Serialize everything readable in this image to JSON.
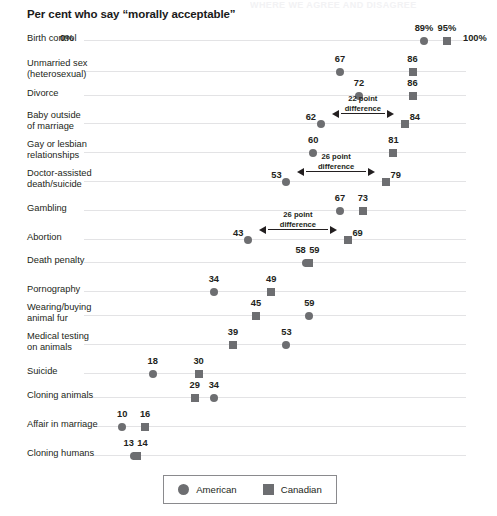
{
  "cutoff_text": "WHERE WE AGREE AND DISAGREE",
  "chart_title": "Per cent who say “morally acceptable”",
  "axis": {
    "min_label": "0%",
    "max_label": "100%",
    "min": 0,
    "max": 100
  },
  "legend": {
    "american_label": "American",
    "canadian_label": "Canadian",
    "american_marker": "circle-marker",
    "canadian_marker": "square-marker"
  },
  "colors": {
    "marker": "#6d6e71",
    "axis_line": "#e3e3e5",
    "text": "#231f20"
  },
  "chart_data": {
    "type": "scatter",
    "title": "Per cent who say “morally acceptable”",
    "xlabel": "",
    "ylabel": "",
    "xlim": [
      0,
      100
    ],
    "grid": false,
    "legend_position": "bottom",
    "series": [
      {
        "name": "American",
        "marker": "circle",
        "values": [
          89,
          67,
          72,
          62,
          60,
          53,
          67,
          43,
          58,
          34,
          59,
          53,
          18,
          34,
          10,
          13
        ]
      },
      {
        "name": "Canadian",
        "marker": "square",
        "values": [
          95,
          86,
          86,
          84,
          81,
          79,
          73,
          69,
          59,
          49,
          45,
          39,
          30,
          29,
          16,
          14
        ]
      }
    ],
    "categories": [
      "Birth control",
      "Unmarried sex\n(heterosexual)",
      "Divorce",
      "Baby outside\nof marriage",
      "Gay or lesbian\nrelationships",
      "Doctor-assisted\ndeath/suicide",
      "Gambling",
      "Abortion",
      "Death penalty",
      "Pornography",
      "Wearing/buying\nanimal fur",
      "Medical testing\non animals",
      "Suicide",
      "Cloning animals",
      "Affair in marriage",
      "Cloning humans"
    ],
    "annotations": [
      {
        "category": "Baby outside\nof marriage",
        "text": "22 point\ndifference",
        "from": 62,
        "to": 84
      },
      {
        "category": "Doctor-assisted\ndeath/suicide",
        "text": "26 point\ndifference",
        "from": 53,
        "to": 79
      },
      {
        "category": "Abortion",
        "text": "26 point\ndifference",
        "from": 43,
        "to": 69
      }
    ]
  },
  "rows": [
    {
      "label": "Birth control",
      "lines": 1,
      "y": 40,
      "american": 89,
      "canadian": 95,
      "am_label": "89%",
      "ca_label": "95%",
      "am_lab_dx": 0,
      "ca_lab_dx": 0,
      "annotation": null
    },
    {
      "label": "Unmarried sex\n(heterosexual)",
      "lines": 2,
      "y": 71,
      "american": 67,
      "canadian": 86,
      "am_label": "67",
      "ca_label": "86",
      "am_lab_dx": 0,
      "ca_lab_dx": 0,
      "annotation": null
    },
    {
      "label": "Divorce",
      "lines": 1,
      "y": 95,
      "american": 72,
      "canadian": 86,
      "am_label": "72",
      "ca_label": "86",
      "am_lab_dx": 0,
      "ca_lab_dx": 0,
      "annotation": null
    },
    {
      "label": "Baby outside\nof marriage",
      "lines": 2,
      "y": 123,
      "american": 62,
      "canadian": 84,
      "am_label": "62",
      "ca_label": "84",
      "am_lab_dx": -10,
      "ca_lab_dx": 10,
      "annotation": {
        "text": "22 point\ndifference",
        "from": 62,
        "to": 84
      }
    },
    {
      "label": "Gay or lesbian\nrelationships",
      "lines": 2,
      "y": 152,
      "american": 60,
      "canadian": 81,
      "am_label": "60",
      "ca_label": "81",
      "am_lab_dx": 0,
      "ca_lab_dx": 0,
      "annotation": null
    },
    {
      "label": "Doctor-assisted\ndeath/suicide",
      "lines": 2,
      "y": 181,
      "american": 53,
      "canadian": 79,
      "am_label": "53",
      "ca_label": "79",
      "am_lab_dx": -10,
      "ca_lab_dx": 10,
      "annotation": {
        "text": "26 point\ndifference",
        "from": 53,
        "to": 79
      }
    },
    {
      "label": "Gambling",
      "lines": 1,
      "y": 210,
      "american": 67,
      "canadian": 73,
      "am_label": "67",
      "ca_label": "73",
      "am_lab_dx": 0,
      "ca_lab_dx": 0,
      "annotation": null
    },
    {
      "label": "Abortion",
      "lines": 1,
      "y": 239,
      "american": 43,
      "canadian": 69,
      "am_label": "43",
      "ca_label": "69",
      "am_lab_dx": -10,
      "ca_lab_dx": 10,
      "annotation": {
        "text": "26 point\ndifference",
        "from": 43,
        "to": 69
      }
    },
    {
      "label": "Death penalty",
      "lines": 1,
      "y": 262,
      "american": 58,
      "canadian": 59,
      "am_label": "58",
      "ca_label": "59",
      "am_lab_dx": -5,
      "ca_lab_dx": 5,
      "annotation": null
    },
    {
      "label": "Pornography",
      "lines": 1,
      "y": 291,
      "american": 34,
      "canadian": 49,
      "am_label": "34",
      "ca_label": "49",
      "am_lab_dx": 0,
      "ca_lab_dx": 0,
      "annotation": null
    },
    {
      "label": "Wearing/buying\nanimal fur",
      "lines": 2,
      "y": 315,
      "american": 59,
      "canadian": 45,
      "am_label": "59",
      "ca_label": "45",
      "am_lab_dx": 0,
      "ca_lab_dx": 0,
      "annotation": null
    },
    {
      "label": "Medical testing\non animals",
      "lines": 2,
      "y": 344,
      "american": 53,
      "canadian": 39,
      "am_label": "53",
      "ca_label": "39",
      "am_lab_dx": 0,
      "ca_lab_dx": 0,
      "annotation": null
    },
    {
      "label": "Suicide",
      "lines": 1,
      "y": 373,
      "american": 18,
      "canadian": 30,
      "am_label": "18",
      "ca_label": "30",
      "am_lab_dx": 0,
      "ca_lab_dx": 0,
      "annotation": null
    },
    {
      "label": "Cloning animals",
      "lines": 1,
      "y": 397,
      "american": 34,
      "canadian": 29,
      "am_label": "34",
      "ca_label": "29",
      "am_lab_dx": 0,
      "ca_lab_dx": 0,
      "annotation": null
    },
    {
      "label": "Affair in marriage",
      "lines": 1,
      "y": 426,
      "american": 10,
      "canadian": 16,
      "am_label": "10",
      "ca_label": "16",
      "am_lab_dx": 0,
      "ca_lab_dx": 0,
      "annotation": null
    },
    {
      "label": "Cloning humans",
      "lines": 1,
      "y": 455,
      "american": 13,
      "canadian": 14,
      "am_label": "13",
      "ca_label": "14",
      "am_lab_dx": -5,
      "ca_lab_dx": 5,
      "annotation": null
    }
  ]
}
